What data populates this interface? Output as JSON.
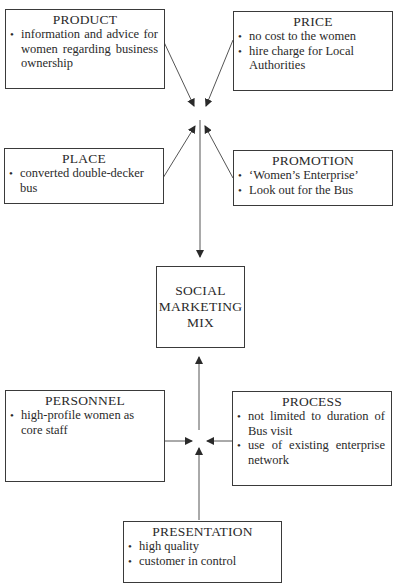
{
  "diagram": {
    "center": {
      "lines": [
        "SOCIAL",
        "MARKETING",
        "MIX"
      ]
    },
    "boxes": {
      "product": {
        "title": "PRODUCT",
        "items": [
          "information and advice for women regarding business ownership"
        ]
      },
      "price": {
        "title": "PRICE",
        "items": [
          "no cost to the women",
          "hire charge for Local Authorities"
        ]
      },
      "place": {
        "title": "PLACE",
        "items": [
          "converted double-decker bus"
        ]
      },
      "promotion": {
        "title": "PROMOTION",
        "items": [
          "‘Women’s Enterprise’",
          "Look out for the Bus"
        ]
      },
      "personnel": {
        "title": "PERSONNEL",
        "items": [
          "high-profile women as core staff"
        ]
      },
      "process": {
        "title": "PROCESS",
        "items": [
          "not limited to duration of Bus visit",
          "use of existing enterprise network"
        ]
      },
      "presentation": {
        "title": "PRESENTATION",
        "items": [
          "high quality",
          "customer in control"
        ]
      }
    },
    "colors": {
      "line": "#3a3a3a",
      "text": "#2a2a2a"
    }
  }
}
